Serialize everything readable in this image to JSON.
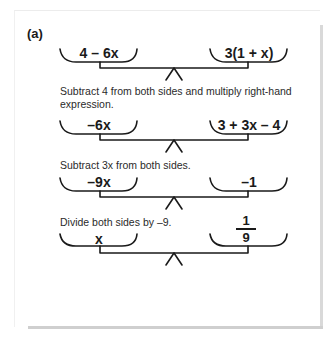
{
  "figure": {
    "part_label": "(a)",
    "rows": [
      {
        "left": "4 – 6x",
        "right": "3(1 + x)"
      },
      {
        "left": "–6x",
        "right": "3 + 3x – 4"
      },
      {
        "left": "–9x",
        "right": "–1"
      },
      {
        "left": "x",
        "right_fraction": {
          "numerator": "1",
          "denominator": "9"
        }
      }
    ],
    "steps": [
      "Subtract 4 from both sides and multiply right-hand expression.",
      "Subtract 3x from both sides.",
      "Divide both sides by –9."
    ]
  },
  "colors": {
    "ink": "#1a1a1a",
    "card_shadow": "#d9d9d9"
  }
}
